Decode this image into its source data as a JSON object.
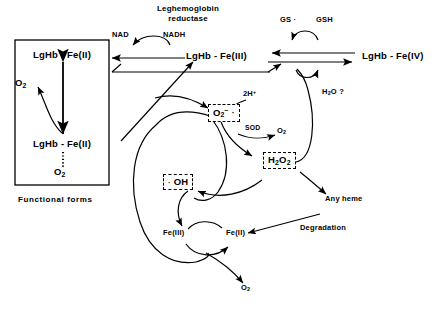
{
  "diagram": {
    "functional_box": {
      "caption": "Functional forms",
      "top_species": "LgHb - Fe(II)",
      "bottom_species": "LgHb - Fe(II)",
      "oxygen_released": "O2",
      "bound_oxygen": "O2"
    },
    "enzyme": {
      "name_line1": "Leghemoglobin",
      "name_line2": "reductase",
      "substrate": "NADH",
      "product": "NAD"
    },
    "species": {
      "ferric": "LgHb - Fe(III)",
      "ferryl": "LgHb - Fe(IV)",
      "glutathione_radical": "GS ·",
      "glutathione": "GSH",
      "water": "H2O ?",
      "superoxide": "O2− ·",
      "protons": "2H+",
      "sod": "SOD",
      "dioxygen_sod": "O2",
      "peroxide": "H2O2",
      "hydroxyl_radical": "· OH",
      "iron_three": "Fe(III)",
      "iron_two": "Fe(II)",
      "dioxygen_fenton": "O2",
      "any_heme": "Any heme",
      "degradation": "Degradation"
    },
    "colors": {
      "stroke": "#000000",
      "background": "#ffffff",
      "box_border": "#000000"
    }
  }
}
